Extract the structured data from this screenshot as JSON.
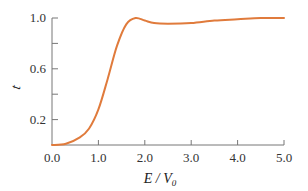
{
  "chart_data": {
    "type": "line",
    "title": "",
    "xlabel": "E/V0",
    "xlabel_main": "E / V",
    "xlabel_sub": "0",
    "ylabel": "t",
    "xlim": [
      0,
      5.0
    ],
    "ylim": [
      0,
      1.0
    ],
    "grid": false,
    "legend": null,
    "x_ticks": [
      "0.0",
      "1.0",
      "2.0",
      "3.0",
      "4.0",
      "5.0"
    ],
    "y_ticks": [
      "0.2",
      "0.6",
      "1.0"
    ],
    "y_minor_ticks": [
      0.4,
      0.8
    ],
    "series": [
      {
        "name": "t",
        "color": "#e07b3c",
        "x": [
          0.0,
          0.3,
          0.6,
          0.8,
          1.0,
          1.2,
          1.4,
          1.6,
          1.8,
          2.0,
          2.2,
          2.5,
          3.0,
          3.5,
          4.0,
          4.5,
          5.0
        ],
        "y": [
          0.0,
          0.01,
          0.06,
          0.13,
          0.28,
          0.52,
          0.78,
          0.95,
          1.0,
          0.98,
          0.96,
          0.955,
          0.96,
          0.98,
          0.99,
          1.0,
          1.0
        ]
      }
    ]
  }
}
